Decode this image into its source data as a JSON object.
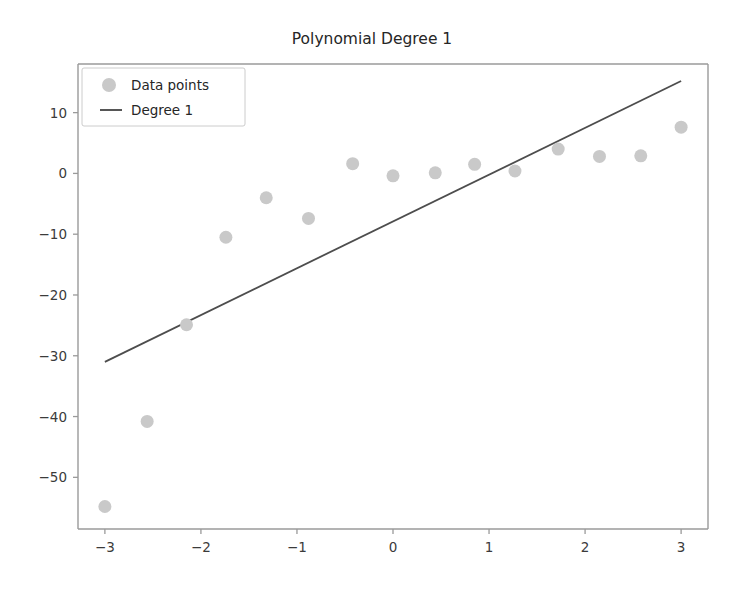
{
  "chart_data": {
    "type": "scatter",
    "title": "Polynomial Degree 1",
    "xlabel": "",
    "ylabel": "",
    "xlim": [
      -3.28,
      3.28
    ],
    "ylim": [
      -58.5,
      18.0
    ],
    "xticks": [
      -3,
      -2,
      -1,
      0,
      1,
      2,
      3
    ],
    "xticklabels": [
      "−3",
      "−2",
      "−1",
      "0",
      "1",
      "2",
      "3"
    ],
    "yticks": [
      10,
      0,
      -10,
      -20,
      -30,
      -40,
      -50
    ],
    "yticklabels": [
      "10",
      "0",
      "−10",
      "−20",
      "−30",
      "−40",
      "−50"
    ],
    "grid": false,
    "legend_position": "upper left",
    "series": [
      {
        "name": "Data points",
        "type": "scatter",
        "marker": "circle",
        "color": "#c9c9c9",
        "marker_size": 13,
        "points": [
          {
            "x": -3.0,
            "y": -54.8
          },
          {
            "x": -2.56,
            "y": -40.8
          },
          {
            "x": -2.15,
            "y": -24.9
          },
          {
            "x": -1.74,
            "y": -10.5
          },
          {
            "x": -1.32,
            "y": -4.0
          },
          {
            "x": -0.88,
            "y": -7.4
          },
          {
            "x": -0.42,
            "y": 1.6
          },
          {
            "x": 0.0,
            "y": -0.4
          },
          {
            "x": 0.44,
            "y": 0.1
          },
          {
            "x": 0.85,
            "y": 1.5
          },
          {
            "x": 1.27,
            "y": 0.4
          },
          {
            "x": 1.72,
            "y": 4.0
          },
          {
            "x": 2.15,
            "y": 2.8
          },
          {
            "x": 2.58,
            "y": 2.9
          },
          {
            "x": 3.0,
            "y": 7.6
          }
        ]
      },
      {
        "name": "Degree 1",
        "type": "line",
        "color": "#4d4d4d",
        "line_width": 1.8,
        "slope": 7.7,
        "intercept": -7.9,
        "points": [
          {
            "x": -3.0,
            "y": -31.0
          },
          {
            "x": 3.0,
            "y": 15.2
          }
        ]
      }
    ]
  },
  "legend": {
    "entries": [
      {
        "label": "Data points",
        "marker": "circle",
        "color": "#c9c9c9"
      },
      {
        "label": "Degree 1",
        "marker": "line",
        "color": "#4d4d4d"
      }
    ]
  }
}
